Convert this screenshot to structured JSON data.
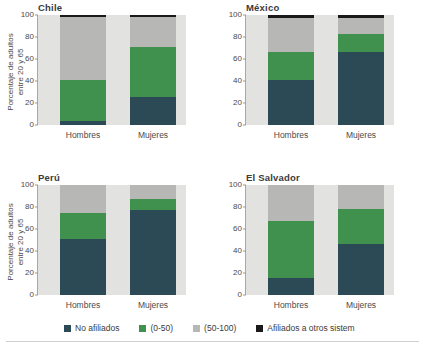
{
  "axis": {
    "ylabel_line1": "Porcentaje de adultos",
    "ylabel_line2": "entre 20 y 65",
    "yticks": [
      "100",
      "80",
      "60",
      "40",
      "20",
      "0"
    ],
    "xcats": [
      "Hombres",
      "Mujeres"
    ]
  },
  "colors": {
    "no_afiliados": "#2b4a56",
    "cotiza_0_50": "#41914e",
    "cotiza_50_100": "#b7b7b6",
    "otros_sistemas": "#1a1a1a",
    "plot_background": "#e2e2e1"
  },
  "legend": {
    "items": [
      {
        "label": "No afiliados",
        "color": "#2b4a56",
        "key": "no_afiliados"
      },
      {
        "label": "(0-50)",
        "color": "#41914e",
        "key": "cotiza_0_50"
      },
      {
        "label": "(50-100)",
        "color": "#b7b7b6",
        "key": "cotiza_50_100"
      },
      {
        "label": "Afiliados a otros sistem",
        "color": "#1a1a1a",
        "key": "otros_sistemas"
      }
    ]
  },
  "chart_data": {
    "type": "bar",
    "title": "",
    "xlabel": "",
    "ylabel": "Porcentaje de adultos entre 20 y 65",
    "ylim": [
      0,
      100
    ],
    "yticks": [
      0,
      20,
      40,
      60,
      80,
      100
    ],
    "grid": false,
    "stacked": true,
    "stack_total": 100,
    "legend_position": "bottom",
    "categories": [
      "Hombres",
      "Mujeres"
    ],
    "series_names": [
      "No afiliados",
      "(0-50)",
      "(50-100)",
      "Afiliados a otros sistem"
    ],
    "panels": [
      {
        "title": "Chile",
        "series": [
          {
            "name": "No afiliados",
            "color": "#2b4a56",
            "values": [
              3.5,
              25.5
            ]
          },
          {
            "name": "(0-50)",
            "color": "#41914e",
            "values": [
              37.0,
              45.0
            ]
          },
          {
            "name": "(50-100)",
            "color": "#b7b7b6",
            "values": [
              58.0,
              28.0
            ]
          },
          {
            "name": "Afiliados a otros sistem",
            "color": "#1a1a1a",
            "values": [
              1.5,
              1.5
            ]
          }
        ]
      },
      {
        "title": "México",
        "series": [
          {
            "name": "No afiliados",
            "color": "#2b4a56",
            "values": [
              40.5,
              66.5
            ]
          },
          {
            "name": "(0-50)",
            "color": "#41914e",
            "values": [
              26.0,
              16.5
            ]
          },
          {
            "name": "(50-100)",
            "color": "#b7b7b6",
            "values": [
              30.5,
              14.0
            ]
          },
          {
            "name": "Afiliados a otros sistem",
            "color": "#1a1a1a",
            "values": [
              3.0,
              3.0
            ]
          }
        ]
      },
      {
        "title": "Perú",
        "series": [
          {
            "name": "No afiliados",
            "color": "#2b4a56",
            "values": [
              51.0,
              77.0
            ]
          },
          {
            "name": "(0-50)",
            "color": "#41914e",
            "values": [
              23.5,
              10.5
            ]
          },
          {
            "name": "(50-100)",
            "color": "#b7b7b6",
            "values": [
              25.5,
              12.5
            ]
          },
          {
            "name": "Afiliados a otros sistem",
            "color": "#1a1a1a",
            "values": [
              0,
              0
            ]
          }
        ]
      },
      {
        "title": "El Salvador",
        "series": [
          {
            "name": "No afiliados",
            "color": "#2b4a56",
            "values": [
              15.5,
              46.0
            ]
          },
          {
            "name": "(0-50)",
            "color": "#41914e",
            "values": [
              52.0,
              32.0
            ]
          },
          {
            "name": "(50-100)",
            "color": "#b7b7b6",
            "values": [
              32.5,
              22.0
            ]
          },
          {
            "name": "Afiliados a otros sistem",
            "color": "#1a1a1a",
            "values": [
              0,
              0
            ]
          }
        ]
      }
    ]
  }
}
